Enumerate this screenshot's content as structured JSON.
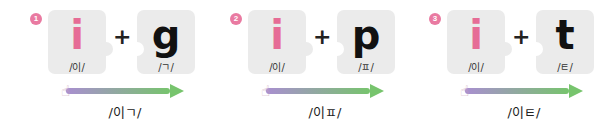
{
  "colors": {
    "badge": "#e97aa1",
    "vowel": "#e66c96",
    "consonant": "#111111",
    "piece": "#ebebeb",
    "arrow_start": "#a98fd0",
    "arrow_end": "#77c46d",
    "arrow_head": "#77c46d"
  },
  "groups": [
    {
      "number": "1",
      "vowel": {
        "letter": "i",
        "sound": "/이/"
      },
      "plus": "+",
      "consonant": {
        "letter": "g",
        "sound": "/ㄱ/"
      },
      "hand_icon": "pointing-hand-icon",
      "result": "/이ㄱ/"
    },
    {
      "number": "2",
      "vowel": {
        "letter": "i",
        "sound": "/이/"
      },
      "plus": "+",
      "consonant": {
        "letter": "p",
        "sound": "/ㅍ/"
      },
      "hand_icon": "pointing-hand-icon",
      "result": "/이ㅍ/"
    },
    {
      "number": "3",
      "vowel": {
        "letter": "i",
        "sound": "/이/"
      },
      "plus": "+",
      "consonant": {
        "letter": "t",
        "sound": "/ㅌ/"
      },
      "hand_icon": "pointing-hand-icon",
      "result": "/이ㅌ/"
    }
  ]
}
